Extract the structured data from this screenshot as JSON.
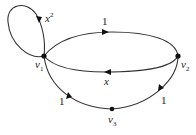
{
  "graph": {
    "nodes": [
      {
        "id": "v1",
        "label": "v",
        "sub": "1"
      },
      {
        "id": "v2",
        "label": "v",
        "sub": "2"
      },
      {
        "id": "v3",
        "label": "v",
        "sub": "3"
      }
    ],
    "edges": [
      {
        "from": "v1",
        "to": "v1",
        "weight": "x",
        "sup": "2"
      },
      {
        "from": "v1",
        "to": "v2",
        "weight": "1"
      },
      {
        "from": "v2",
        "to": "v1",
        "weight": "x"
      },
      {
        "from": "v2",
        "to": "v3",
        "weight": "1"
      },
      {
        "from": "v3",
        "to": "v1",
        "weight": "1"
      }
    ]
  },
  "labels": {
    "loop_base": "x",
    "loop_exp": "2",
    "top_edge": "1",
    "bottom_edge": "x",
    "v2_v3_edge": "1",
    "v3_v1_edge": "1",
    "v1_base": "v",
    "v1_sub": "1",
    "v2_base": "v",
    "v2_sub": "2",
    "v3_base": "v",
    "v3_sub": "3"
  }
}
